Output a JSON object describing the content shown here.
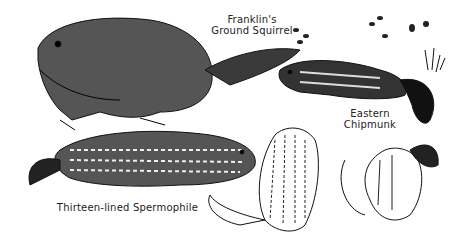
{
  "illustration": {
    "labels": {
      "franklins": [
        "Franklin's",
        "Ground Squirrel"
      ],
      "chipmunk": [
        "Eastern",
        "Chipmunk"
      ],
      "spermophile": "Thirteen-lined Spermophile"
    },
    "colors": {
      "ink": "#1a1a1a",
      "paper": "#ffffff"
    }
  }
}
